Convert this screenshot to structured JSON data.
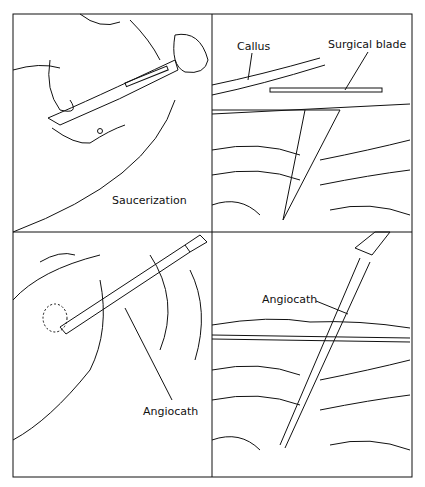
{
  "panels": [
    {
      "id": "top-left",
      "labels": [
        "Saucerization"
      ]
    },
    {
      "id": "top-right",
      "labels": [
        "Callus",
        "Surgical blade"
      ]
    },
    {
      "id": "bottom-left",
      "labels": [
        "Angiocath"
      ]
    },
    {
      "id": "bottom-right",
      "labels": [
        "Angiocath"
      ]
    }
  ]
}
